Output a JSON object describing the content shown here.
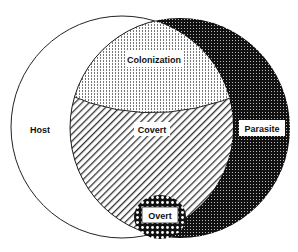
{
  "diagram": {
    "type": "venn",
    "sets": [
      {
        "id": "host",
        "label": "Host"
      },
      {
        "id": "parasite",
        "label": "Parasite"
      }
    ],
    "regions": {
      "host_only": {
        "label": "Host",
        "fill": "white"
      },
      "parasite_only": {
        "label": "Parasite",
        "fill": "dense dark dots"
      },
      "colonization": {
        "label": "Colonization",
        "fill": "fine dots"
      },
      "covert": {
        "label": "Covert",
        "fill": "diagonal hatch"
      },
      "overt": {
        "label": "Overt",
        "fill": "checker / large dots"
      }
    },
    "colors": {
      "stroke": "#222222",
      "dark": "#1a1a1a",
      "background": "#ffffff"
    }
  }
}
